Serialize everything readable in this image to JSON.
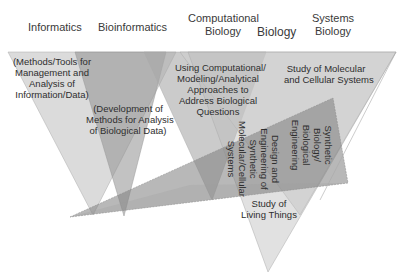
{
  "headers": {
    "informatics": "Informatics",
    "bioinformatics": "Bioinformatics",
    "computational_biology_line1": "Computational",
    "computational_biology_line2": "Biology",
    "biology": "Biology",
    "systems_biology_line1": "Systems",
    "systems_biology_line2": "Biology"
  },
  "descriptions": {
    "informatics": [
      "(Methods/Tools for",
      "Management and",
      "Analysis of",
      "Information/Data)"
    ],
    "bioinformatics": [
      "(Development of",
      "Methods for Analysis",
      "of Biological Data)"
    ],
    "computational_biology": [
      "Using Computational/",
      "Modeling/Analytical",
      "Approaches to",
      "Address Biological",
      "Questions"
    ],
    "systems_biology": [
      "Study of Molecular",
      "and Cellular Systems"
    ],
    "biology": [
      "Study of",
      "Living Things"
    ],
    "synthetic_biology": [
      "Synthetic",
      "Biology/",
      "Biological",
      "Engineering"
    ],
    "design_engineering": [
      "Design and",
      "Engineering of",
      "Synthetic",
      "Molecular/Cellular",
      "Systems"
    ]
  },
  "colors": {
    "informatics_fill": "#d4d4d4",
    "bioinformatics_fill": "#9a9a9a",
    "computational_fill": "#b5b5b5",
    "systems_fill": "#d0d0d0",
    "biology_fill": "#c4c4c4",
    "synthetic_fill": "#8c8c8c"
  }
}
